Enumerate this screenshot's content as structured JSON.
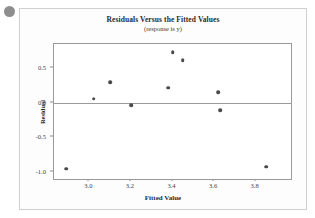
{
  "decoration": {
    "bullet_name": "gray-bullet-marker"
  },
  "chart_data": {
    "type": "scatter",
    "title": "Residuals Versus the Fitted Values",
    "subtitle": "(response is y)",
    "xlabel": "Fitted Value",
    "ylabel": "Residual",
    "xlim": [
      2.83,
      3.97
    ],
    "ylim": [
      -1.1,
      0.85
    ],
    "xticks": [
      3.0,
      3.2,
      3.4,
      3.6,
      3.8
    ],
    "xtick_labels": [
      "3.0",
      "3.2",
      "3.4",
      "3.6",
      "3.8"
    ],
    "yticks": [
      0.5,
      0.0,
      -0.5,
      -1.0
    ],
    "ytick_labels": [
      "0.5",
      "0.0",
      "-0.5",
      "-1.0"
    ],
    "grid": false,
    "legend": false,
    "reference_line": {
      "axis": "y",
      "value": 0.0
    },
    "points": [
      {
        "x": 2.89,
        "y": -0.95
      },
      {
        "x": 3.02,
        "y": 0.06
      },
      {
        "x": 3.1,
        "y": 0.3
      },
      {
        "x": 3.2,
        "y": -0.03
      },
      {
        "x": 3.38,
        "y": 0.22
      },
      {
        "x": 3.4,
        "y": 0.73
      },
      {
        "x": 3.45,
        "y": 0.62
      },
      {
        "x": 3.62,
        "y": 0.15
      },
      {
        "x": 3.63,
        "y": -0.11
      },
      {
        "x": 3.85,
        "y": -0.92
      }
    ]
  }
}
